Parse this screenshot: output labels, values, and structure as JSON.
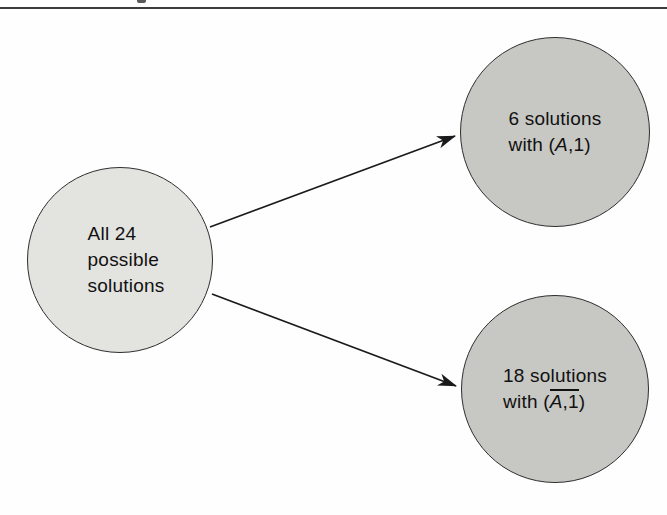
{
  "figure": {
    "background": "#fefefe",
    "top_rule_color": "#3c3c3c",
    "arrow_color": "#1a1a1a",
    "circles": {
      "all": {
        "lines": [
          "All 24",
          "possible",
          "solutions"
        ],
        "fill": "#e3e3e0",
        "stroke": "#2e2e2e"
      },
      "with_a1": {
        "line1": "6 solutions",
        "line2_prefix": "with (",
        "line2_var": "A",
        "line2_suffix": ",1)",
        "fill": "#c7c7c4",
        "stroke": "#2e2e2e"
      },
      "without_a1": {
        "line1": "18 solutions",
        "line2_prefix": "with (",
        "overline_var": "A",
        "overline_rest": ",1",
        "line2_suffix": ")",
        "fill": "#c7c7c4",
        "stroke": "#2e2e2e"
      }
    }
  }
}
